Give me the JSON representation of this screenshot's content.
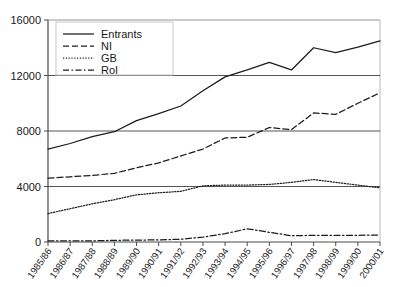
{
  "chart_data": {
    "type": "line",
    "title": "",
    "subtitle": "",
    "xlabel": "",
    "ylabel": "",
    "grid": true,
    "legend_position": "top-left",
    "ylim": [
      0,
      16000
    ],
    "ytick_labels": [
      "0",
      "4000",
      "8000",
      "12000",
      "16000"
    ],
    "ytick_values": [
      0,
      4000,
      8000,
      12000,
      16000
    ],
    "categories": [
      "1985/86",
      "1986/87",
      "1987/88",
      "1988/89",
      "1989/90",
      "1990/91",
      "1991/92",
      "1992/93",
      "1993/94",
      "1994/95",
      "1995/96",
      "1996/97",
      "1997/98",
      "1998/99",
      "1999/00",
      "2000/01"
    ],
    "series": [
      {
        "name": "Entrants",
        "style": "solid",
        "values": [
          6700,
          7100,
          7600,
          7950,
          8750,
          9250,
          9800,
          10900,
          11900,
          12400,
          12950,
          12400,
          14000,
          13650,
          14050,
          14500
        ]
      },
      {
        "name": "NI",
        "style": "dashed",
        "values": [
          4600,
          4700,
          4800,
          4950,
          5350,
          5700,
          6200,
          6700,
          7500,
          7550,
          8250,
          8100,
          9300,
          9200,
          10000,
          10750
        ]
      },
      {
        "name": "GB",
        "style": "dotted",
        "values": [
          2050,
          2400,
          2750,
          3050,
          3400,
          3550,
          3650,
          4050,
          4100,
          4100,
          4150,
          4300,
          4500,
          4300,
          4100,
          3900
        ]
      },
      {
        "name": "RoI",
        "style": "dash-dot",
        "values": [
          80,
          90,
          80,
          120,
          140,
          150,
          200,
          350,
          600,
          950,
          700,
          450,
          480,
          480,
          480,
          500
        ]
      }
    ]
  },
  "legend": {
    "entries": [
      {
        "label": "Entrants"
      },
      {
        "label": "NI"
      },
      {
        "label": "GB"
      },
      {
        "label": "RoI"
      }
    ]
  },
  "colors": {
    "line": "#1c1c1c",
    "grid": "#555555",
    "axis": "#4a4a4a",
    "background": "#ffffff"
  }
}
